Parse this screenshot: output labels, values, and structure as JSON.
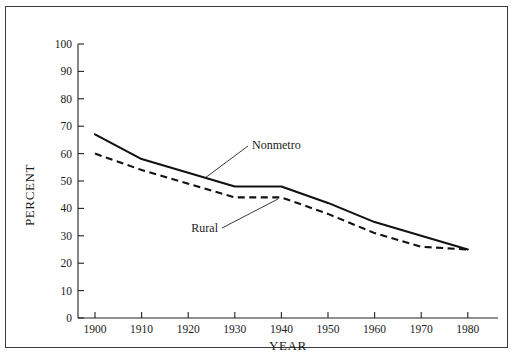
{
  "figure": {
    "top_crop_remnant": "............................................",
    "background_color": "#ffffff",
    "frame_color": "#3d3d3d",
    "ink_color": "#111111"
  },
  "chart_data": {
    "type": "line",
    "title": "",
    "subtitle": "",
    "xlabel": "YEAR",
    "ylabel": "PERCENT",
    "x": [
      1900,
      1910,
      1920,
      1930,
      1940,
      1950,
      1960,
      1970,
      1980
    ],
    "categories": [
      "1900",
      "1910",
      "1920",
      "1930",
      "1940",
      "1950",
      "1960",
      "1970",
      "1980"
    ],
    "xlim": [
      1900,
      1980
    ],
    "ylim": [
      0,
      100
    ],
    "xticks": [
      1900,
      1910,
      1920,
      1930,
      1940,
      1950,
      1960,
      1970,
      1980
    ],
    "xtick_labels": [
      "1900",
      "1910",
      "1920",
      "1930",
      "1940",
      "1950",
      "1960",
      "1970",
      "1980"
    ],
    "yticks": [
      0,
      10,
      20,
      30,
      40,
      50,
      60,
      70,
      80,
      90,
      100
    ],
    "ytick_labels": [
      "0",
      "10",
      "20",
      "30",
      "40",
      "50",
      "60",
      "70",
      "80",
      "90",
      "100"
    ],
    "grid": false,
    "legend_position": "inline-annotations",
    "series": [
      {
        "name": "Nonmetro",
        "style": "solid",
        "color": "#111111",
        "values": [
          67,
          58,
          53,
          48,
          48,
          42,
          35,
          30,
          25
        ],
        "label_x": 1932,
        "label_y": 56
      },
      {
        "name": "Rural",
        "style": "dashed",
        "color": "#111111",
        "values": [
          60,
          54,
          49,
          44,
          44,
          38,
          31,
          26,
          25
        ],
        "label_x": 1922,
        "label_y": 35
      }
    ],
    "annotations": [
      {
        "text": "Nonmetro",
        "target_x": 1924,
        "target_y": 51
      },
      {
        "text": "Rural",
        "target_x": 1940,
        "target_y": 44
      }
    ]
  }
}
